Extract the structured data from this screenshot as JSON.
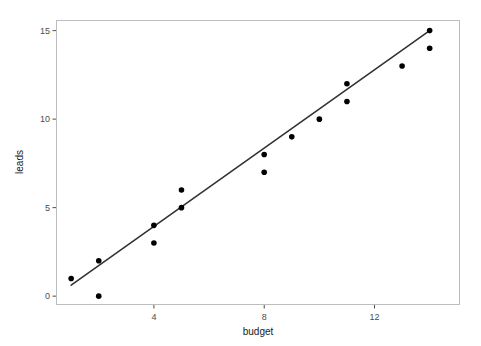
{
  "chart_data": {
    "type": "scatter",
    "title": "",
    "xlabel": "budget",
    "ylabel": "leads",
    "x": [
      1,
      2,
      2,
      4,
      4,
      5,
      5,
      8,
      8,
      9,
      10,
      11,
      11,
      13,
      14,
      14
    ],
    "y": [
      1,
      0,
      2,
      4,
      3,
      6,
      5,
      8,
      7,
      9,
      10,
      12,
      11,
      13,
      15,
      14
    ],
    "points": [
      {
        "budget": 1,
        "leads": 1
      },
      {
        "budget": 2,
        "leads": 0
      },
      {
        "budget": 2,
        "leads": 2
      },
      {
        "budget": 4,
        "leads": 4
      },
      {
        "budget": 4,
        "leads": 3
      },
      {
        "budget": 5,
        "leads": 6
      },
      {
        "budget": 5,
        "leads": 5
      },
      {
        "budget": 8,
        "leads": 8
      },
      {
        "budget": 8,
        "leads": 7
      },
      {
        "budget": 9,
        "leads": 9
      },
      {
        "budget": 10,
        "leads": 10
      },
      {
        "budget": 11,
        "leads": 12
      },
      {
        "budget": 11,
        "leads": 11
      },
      {
        "budget": 13,
        "leads": 13
      },
      {
        "budget": 14,
        "leads": 15
      },
      {
        "budget": 14,
        "leads": 14
      }
    ],
    "series": [
      {
        "name": "observations",
        "type": "scatter",
        "marker": "filled-circle",
        "color": "#000000",
        "size": 3
      },
      {
        "name": "regression-line",
        "type": "line",
        "color": "#333333",
        "width": 1.6,
        "endpoints": [
          {
            "budget": 1,
            "leads": 0.62
          },
          {
            "budget": 14,
            "leads": 15.0
          }
        ]
      }
    ],
    "xticks": [
      4,
      8,
      12
    ],
    "yticks": [
      0,
      5,
      10,
      15
    ],
    "xtick_labels": [
      "4",
      "8",
      "12"
    ],
    "ytick_labels": [
      "0",
      "5",
      "10",
      "15"
    ],
    "xlim": [
      0.45,
      15.1
    ],
    "ylim": [
      -0.5,
      15.6
    ],
    "grid": false,
    "legend": false,
    "legend_position": "none",
    "panel_background": "#ffffff",
    "panel_border_color": "#bdbdbd",
    "tick_color": "#4d4d4d",
    "axis_title_color": "#1a1a1a"
  }
}
